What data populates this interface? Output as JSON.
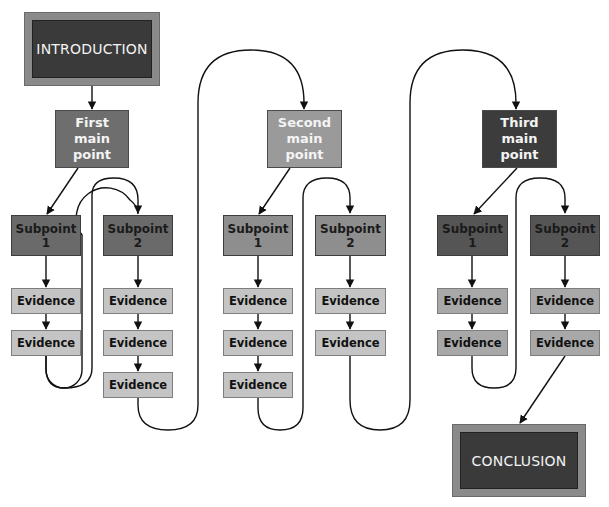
{
  "intro": {
    "label": "INTRODUCTION"
  },
  "conclusion": {
    "label": "CONCLUSION"
  },
  "colors": {
    "frame": "#8a8a8a",
    "frame_inner": "#3a3a3a",
    "main1": "#6e6e6e",
    "main2": "#9a9a9a",
    "main3": "#3c3c3c",
    "sub1": "#6a6a6a",
    "sub2": "#8e8e8e",
    "sub3": "#555555",
    "evidence": "#c4c4c4",
    "connector": "#111111"
  },
  "main_points": [
    {
      "label": "First main point",
      "line1": "First",
      "line2": "main",
      "line3": "point",
      "subpoints": [
        {
          "line1": "Subpoint",
          "line2": "1",
          "evidence": [
            "Evidence",
            "Evidence"
          ]
        },
        {
          "line1": "Subpoint",
          "line2": "2",
          "evidence": [
            "Evidence",
            "Evidence",
            "Evidence"
          ]
        }
      ]
    },
    {
      "label": "Second main point",
      "line1": "Second",
      "line2": "main",
      "line3": "point",
      "subpoints": [
        {
          "line1": "Subpoint",
          "line2": "1",
          "evidence": [
            "Evidence",
            "Evidence",
            "Evidence"
          ]
        },
        {
          "line1": "Subpoint",
          "line2": "2",
          "evidence": [
            "Evidence",
            "Evidence"
          ]
        }
      ]
    },
    {
      "label": "Third main point",
      "line1": "Third",
      "line2": "main",
      "line3": "point",
      "subpoints": [
        {
          "line1": "Subpoint",
          "line2": "1",
          "evidence": [
            "Evidence",
            "Evidence"
          ]
        },
        {
          "line1": "Subpoint",
          "line2": "2",
          "evidence": [
            "Evidence",
            "Evidence"
          ]
        }
      ]
    }
  ]
}
